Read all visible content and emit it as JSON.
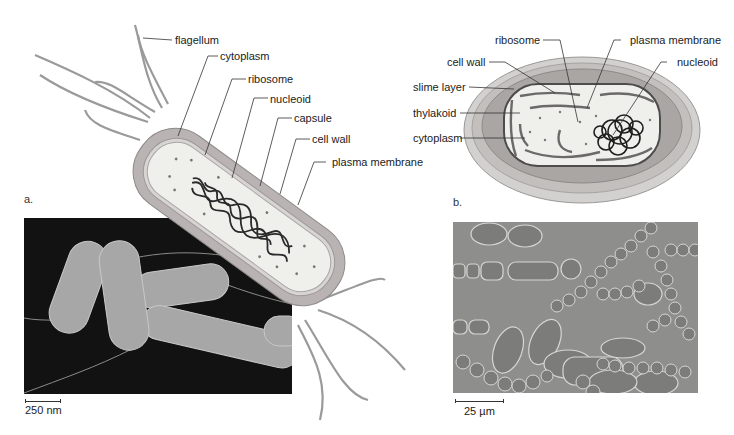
{
  "panel_a": {
    "letter": "a.",
    "labels": {
      "flagellum": "flagellum",
      "cytoplasm": "cytoplasm",
      "ribosome": "ribosome",
      "nucleoid": "nucleoid",
      "capsule": "capsule",
      "cell_wall": "cell wall",
      "plasma_membrane": "plasma membrane"
    },
    "micrograph": {
      "type": "SEM of rod-shaped bacteria",
      "scale_bar": "250 nm"
    }
  },
  "panel_b": {
    "letter": "b.",
    "labels": {
      "ribosome": "ribosome",
      "plasma_membrane": "plasma membrane",
      "cell_wall": "cell wall",
      "nucleoid": "nucleoid",
      "slime_layer": "slime layer",
      "thylakoid": "thylakoid",
      "cytoplasm": "cytoplasm"
    },
    "micrograph": {
      "type": "light micrograph of filamentous cyanobacteria",
      "scale_bar": "25 µm"
    }
  },
  "colors": {
    "capsule": "#b9b4b3",
    "cell_wall": "#d8d4d2",
    "cytoplasm": "#efefec",
    "nucleoid": "#2a2a2a",
    "sem_bg": "#111111",
    "lm_bg": "#8e8e8c"
  }
}
